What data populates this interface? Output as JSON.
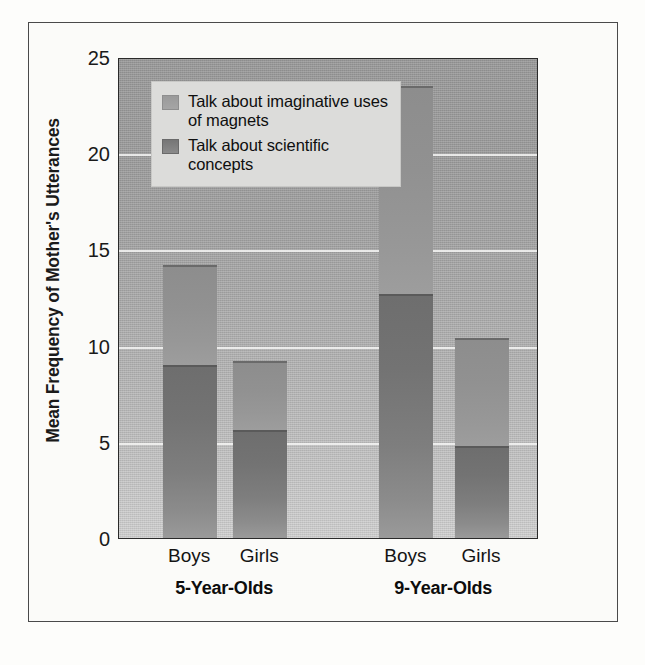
{
  "chart_data": {
    "type": "bar",
    "subtype": "stacked-bar-grouped",
    "title": "",
    "subtitle": "",
    "xlabel": "",
    "ylabel": "Mean Frequency of Mother's Utterances",
    "ylim": [
      0,
      25
    ],
    "yticks": [
      0,
      5,
      10,
      15,
      20,
      25
    ],
    "ytick_labels": [
      "0",
      "5",
      "10",
      "15",
      "20",
      "25"
    ],
    "grid": true,
    "grid_axis": "y",
    "legend_position": "top-left-inside",
    "categories": [
      "Boys",
      "Girls",
      "Boys",
      "Girls"
    ],
    "groups": [
      {
        "label": "5-Year-Olds",
        "categories": [
          "Boys",
          "Girls"
        ]
      },
      {
        "label": "9-Year-Olds",
        "categories": [
          "Boys",
          "Girls"
        ]
      }
    ],
    "series": [
      {
        "name": "Talk about scientific concepts",
        "color": "#787878",
        "values": [
          9.0,
          5.6,
          12.7,
          4.8
        ]
      },
      {
        "name": "Talk about imaginative uses of magnets",
        "color": "#969696",
        "values": [
          5.2,
          3.6,
          10.8,
          5.6
        ]
      }
    ],
    "totals": [
      14.2,
      9.2,
      23.5,
      10.4
    ],
    "bars": [
      {
        "group": "5-Year-Olds",
        "category": "Boys",
        "scientific": 9.0,
        "imaginative": 5.2,
        "total": 14.2
      },
      {
        "group": "5-Year-Olds",
        "category": "Girls",
        "scientific": 5.6,
        "imaginative": 3.6,
        "total": 9.2
      },
      {
        "group": "9-Year-Olds",
        "category": "Boys",
        "scientific": 12.7,
        "imaginative": 10.8,
        "total": 23.5
      },
      {
        "group": "9-Year-Olds",
        "category": "Girls",
        "scientific": 4.8,
        "imaginative": 5.6,
        "total": 10.4
      }
    ]
  },
  "axis": {
    "y_title": "Mean Frequency of Mother's Utterances",
    "y_ticks": [
      "0",
      "5",
      "10",
      "15",
      "20",
      "25"
    ],
    "x_ticks": [
      "Boys",
      "Girls",
      "Boys",
      "Girls"
    ],
    "x_groups": [
      "5-Year-Olds",
      "9-Year-Olds"
    ]
  },
  "legend": {
    "items": [
      {
        "label": "Talk about imaginative uses of magnets",
        "swatch": "imaginative"
      },
      {
        "label": "Talk about scientific concepts",
        "swatch": "scientific"
      }
    ]
  },
  "colors": {
    "plot_background_top": "#9b9b9b",
    "plot_background_bottom": "#d2d2d2",
    "bar_scientific": "#787878",
    "bar_imaginative": "#969696",
    "gridline": "#f6f6f4",
    "frame": "#4a4a4a",
    "text": "#111111",
    "legend_background": "#dcdcda"
  }
}
